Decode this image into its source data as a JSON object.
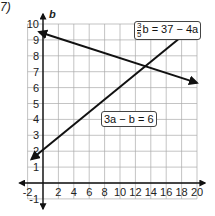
{
  "problem_number": "7)",
  "chart_data": {
    "type": "line",
    "title": "",
    "xlabel": "",
    "ylabel": "b",
    "xlim": [
      -2,
      20
    ],
    "ylim": [
      -1,
      10
    ],
    "x_ticks": [
      "-2",
      "2",
      "4",
      "6",
      "8",
      "10",
      "12",
      "14",
      "16",
      "18",
      "20"
    ],
    "y_ticks": [
      "-1",
      "1",
      "2",
      "3",
      "4",
      "5",
      "6",
      "7",
      "8",
      "9",
      "10"
    ],
    "grid": true,
    "series": [
      {
        "name": "3/5 b = 37 - 4a",
        "x": [
          -0.5,
          20
        ],
        "y": [
          9.5,
          6.3
        ]
      },
      {
        "name": "3a - b = 6",
        "x": [
          -1.5,
          20
        ],
        "y": [
          1.5,
          10
        ]
      }
    ],
    "annotations": [
      {
        "text": "3/5 b = 37 − 4a",
        "numerator": "3",
        "denominator": "5",
        "rest": "b = 37 − 4a"
      },
      {
        "text": "3a − b = 6"
      }
    ]
  },
  "labels": {
    "eq1_num": "3",
    "eq1_den": "5",
    "eq1_rest": "b = 37 − 4a",
    "eq2": "3a − b = 6",
    "y_axis": "b"
  }
}
